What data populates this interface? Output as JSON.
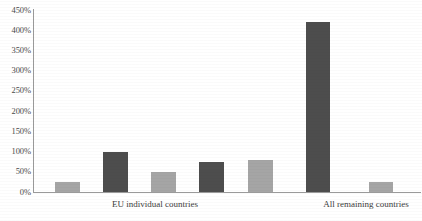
{
  "chart_data": {
    "type": "bar",
    "title": "",
    "subtitle": "",
    "xlabel": "",
    "ylabel": "",
    "ylim": [
      0,
      450
    ],
    "grid": false,
    "legend": null,
    "y_tick_labels": [
      "450%",
      "400%",
      "350%",
      "300%",
      "250%",
      "200%",
      "150%",
      "100%",
      "50%",
      "0%"
    ],
    "y_tick_values": [
      450,
      400,
      350,
      300,
      250,
      200,
      150,
      100,
      50,
      0
    ],
    "categories": [
      "",
      "",
      "",
      "",
      "",
      "",
      ""
    ],
    "values": [
      25,
      100,
      50,
      75,
      80,
      420,
      25
    ],
    "bar_colors": [
      "#a5a5a5",
      "#4d4d4d",
      "#a5a5a5",
      "#4d4d4d",
      "#a5a5a5",
      "#4d4d4d",
      "#a5a5a5"
    ],
    "group_labels": [
      {
        "text": "EU individual countries",
        "center_x": 155
      },
      {
        "text": "All remaining countries",
        "center_x": 366
      }
    ],
    "axis_color": "#9a9a9a"
  },
  "bars_geometry": [
    {
      "left": 55,
      "width": 25,
      "value": 25
    },
    {
      "left": 103,
      "width": 25,
      "value": 100
    },
    {
      "left": 151,
      "width": 25,
      "value": 50
    },
    {
      "left": 199,
      "width": 25,
      "value": 75
    },
    {
      "left": 248,
      "width": 25,
      "value": 80
    },
    {
      "left": 306,
      "width": 24,
      "value": 420
    },
    {
      "left": 369,
      "width": 24,
      "value": 25
    }
  ]
}
